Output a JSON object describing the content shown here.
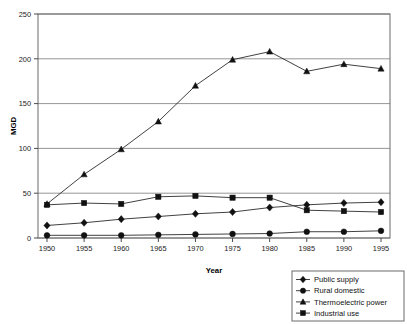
{
  "chart_data": {
    "type": "line",
    "title": "",
    "xlabel": "Year",
    "ylabel": "MGD",
    "x": [
      1950,
      1955,
      1960,
      1965,
      1970,
      1975,
      1980,
      1985,
      1990,
      1995
    ],
    "xtick_labels": [
      "1950",
      "1955",
      "1960",
      "1965",
      "1970",
      "1975",
      "1980",
      "1985",
      "1990",
      "1995"
    ],
    "ytick_labels": [
      "0",
      "50",
      "100",
      "150",
      "200",
      "250"
    ],
    "yticks": [
      0,
      50,
      100,
      150,
      200,
      250
    ],
    "ylim": [
      0,
      250
    ],
    "xlim": [
      1950,
      1995
    ],
    "grid": "horizontal",
    "legend_position": "below-right",
    "series": [
      {
        "name": "Public supply",
        "marker": "diamond",
        "values": [
          14,
          17,
          21,
          24,
          27,
          29,
          34,
          37,
          39,
          40
        ]
      },
      {
        "name": "Rural domestic",
        "marker": "circle",
        "values": [
          3,
          3,
          3,
          3.5,
          4,
          4.5,
          5,
          7,
          7,
          8
        ]
      },
      {
        "name": "Thermoelectric power",
        "marker": "triangle",
        "values": [
          38,
          71,
          99,
          130,
          170,
          199,
          208,
          186,
          194,
          189
        ]
      },
      {
        "name": "Industrial use",
        "marker": "square",
        "values": [
          37,
          39,
          38,
          46,
          47,
          45,
          45,
          31,
          30,
          29
        ]
      }
    ]
  },
  "legend": {
    "items": [
      {
        "label": "Public supply",
        "marker": "diamond"
      },
      {
        "label": "Rural domestic",
        "marker": "circle"
      },
      {
        "label": "Thermoelectric power",
        "marker": "triangle"
      },
      {
        "label": "Industrial use",
        "marker": "square"
      }
    ]
  },
  "colors": {
    "line": "#2b2b2b",
    "marker": "#111111",
    "grid": "#7a7a7a",
    "border": "#6a6a6a",
    "background": "#ffffff"
  }
}
